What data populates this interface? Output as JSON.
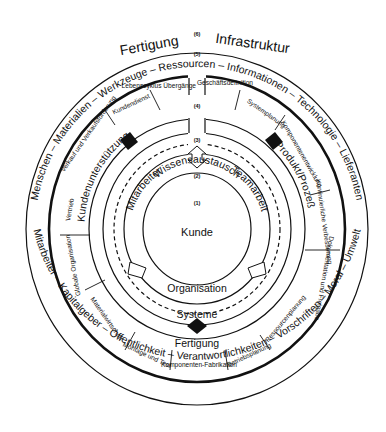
{
  "title_left": "Fertigung",
  "title_right": "Infrastruktur",
  "level_labels": [
    "(1)",
    "(2)",
    "(3)",
    "(4)",
    "(5)",
    "(6)"
  ],
  "outer_ring": {
    "top": "Menschen – Materialien – Werkzeuge – Ressourcen – Informationen – Technologie – Lieferanten",
    "bottom": "Mitarbeiter – Kapitalgeber – Öffentlichkeit – Verantwortlichkeiten – Vorschriften – Moral – Umwelt"
  },
  "segments": {
    "top_left": [
      "Verkauf und Verkaufsförderung",
      "Kundendienst",
      "Lebenszyklus Übergänge"
    ],
    "top_right": [
      "Geschäftsdefinition",
      "Systemplanung",
      "Komponentenentwicklung"
    ],
    "right": [
      "Kontinuierliche Verbesserung",
      "Dokumentation und Freigabe"
    ],
    "left": [
      "Vertrieb",
      "Globale Organisation"
    ],
    "bottom": [
      "Materialwirtschaft",
      "Montage und Test",
      "Komponenten-Fabrikation",
      "Betriebsplanung",
      "Ressourcenplanung"
    ]
  },
  "ring3": {
    "top": "Wissensaustausch",
    "left": "Kundenunterstützung",
    "right": "Produkt/Prozeß",
    "bottom": "Systeme",
    "bottom_inner": "Fertigung"
  },
  "ring2": {
    "left": "Mitarbeiter",
    "right": "Teamarbeit",
    "bottom": "Organisation"
  },
  "center": "Kunde"
}
